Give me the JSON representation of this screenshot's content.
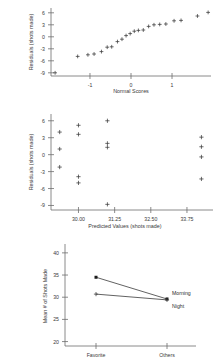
{
  "chart_data": [
    {
      "id": "normal-probability-plot",
      "type": "scatter",
      "title": "",
      "xlabel": "Normal Scores",
      "ylabel": "Residuals (shots made)",
      "xlim": [
        -1.95,
        1.95
      ],
      "ylim": [
        -9.8,
        7.2
      ],
      "xticks": [
        -1,
        0,
        1
      ],
      "xticklabels": [
        "-1",
        "0",
        "1"
      ],
      "yticks": [
        6,
        3,
        0,
        -3,
        -6,
        -9
      ],
      "yticklabels": [
        "6",
        "3",
        "0",
        "-3",
        "-6",
        "-9"
      ],
      "grid": false,
      "legend": "none",
      "marker": "plus",
      "points": [
        {
          "x": -1.85,
          "y": -9.0
        },
        {
          "x": -1.3,
          "y": -4.9
        },
        {
          "x": -1.05,
          "y": -4.5
        },
        {
          "x": -0.9,
          "y": -4.3
        },
        {
          "x": -0.72,
          "y": -3.7
        },
        {
          "x": -0.58,
          "y": -2.6
        },
        {
          "x": -0.47,
          "y": -2.5
        },
        {
          "x": -0.33,
          "y": -1.2
        },
        {
          "x": -0.22,
          "y": -0.6
        },
        {
          "x": -0.12,
          "y": 0.3
        },
        {
          "x": -0.02,
          "y": 0.8
        },
        {
          "x": 0.08,
          "y": 1.4
        },
        {
          "x": 0.18,
          "y": 1.6
        },
        {
          "x": 0.3,
          "y": 1.7
        },
        {
          "x": 0.43,
          "y": 2.6
        },
        {
          "x": 0.56,
          "y": 3.0
        },
        {
          "x": 0.7,
          "y": 3.1
        },
        {
          "x": 0.85,
          "y": 3.2
        },
        {
          "x": 1.05,
          "y": 4.0
        },
        {
          "x": 1.22,
          "y": 4.1
        },
        {
          "x": 1.62,
          "y": 5.2
        },
        {
          "x": 1.88,
          "y": 6.1
        }
      ]
    },
    {
      "id": "residuals-vs-fitted",
      "type": "scatter",
      "title": "",
      "xlabel": "Predicted Values (shots made)",
      "ylabel": "Residuals (shots made)",
      "xlim": [
        29.05,
        34.65
      ],
      "ylim": [
        -9.8,
        7.2
      ],
      "xticks": [
        30.0,
        31.25,
        32.5,
        33.75
      ],
      "xticklabels": [
        "30.00",
        "31.25",
        "32.50",
        "33.75"
      ],
      "yticks": [
        6,
        3,
        0,
        -3,
        -6,
        -9
      ],
      "yticklabels": [
        "6",
        "3",
        "0",
        "-3",
        "-6",
        "-9"
      ],
      "grid": false,
      "legend": "none",
      "marker": "plus",
      "points": [
        {
          "x": 29.35,
          "y": 4.0
        },
        {
          "x": 29.35,
          "y": 1.0
        },
        {
          "x": 29.35,
          "y": -2.2
        },
        {
          "x": 30.0,
          "y": 5.2
        },
        {
          "x": 30.0,
          "y": 3.6
        },
        {
          "x": 30.0,
          "y": -3.9
        },
        {
          "x": 30.0,
          "y": -5.0
        },
        {
          "x": 31.0,
          "y": 6.0
        },
        {
          "x": 31.0,
          "y": 2.0
        },
        {
          "x": 31.0,
          "y": 1.3
        },
        {
          "x": 31.0,
          "y": -8.8
        },
        {
          "x": 34.25,
          "y": 3.1
        },
        {
          "x": 34.25,
          "y": 1.4
        },
        {
          "x": 34.25,
          "y": -0.4
        },
        {
          "x": 34.25,
          "y": -4.3
        }
      ]
    },
    {
      "id": "interaction-plot",
      "type": "line",
      "title": "",
      "xlabel": "",
      "ylabel": "Mean # of Shots Made",
      "categories": [
        "Favorite",
        "Others"
      ],
      "ylim": [
        19.0,
        42.0
      ],
      "yticks": [
        40,
        35,
        30,
        25,
        20
      ],
      "yticklabels": [
        "40",
        "35",
        "30",
        "25",
        "20"
      ],
      "grid": false,
      "legend": "inline-right",
      "series": [
        {
          "name": "Morning",
          "values": [
            34.5,
            29.6
          ],
          "marker": "square"
        },
        {
          "name": "Night",
          "values": [
            30.7,
            29.4
          ],
          "marker": "plus"
        }
      ]
    }
  ]
}
